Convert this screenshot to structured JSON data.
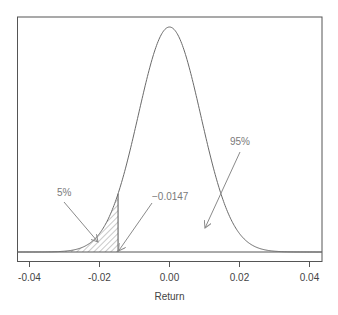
{
  "chart_data": {
    "type": "area",
    "title": "",
    "xlabel": "Return",
    "ylabel": "",
    "xlim": [
      -0.0435,
      0.0435
    ],
    "ylim": [
      0,
      1.0
    ],
    "grid": false,
    "legend": null,
    "distribution": {
      "name": "normal",
      "mean": 0.0,
      "sd": 0.00894
    },
    "x_ticks": [
      -0.04,
      -0.02,
      0.0,
      0.02,
      0.04
    ],
    "x_tick_labels": [
      "-0.04",
      "-0.02",
      "0.00",
      "0.02",
      "0.04"
    ],
    "shaded_region": {
      "from": -0.0435,
      "to": -0.0147,
      "pattern": "diagonal-hatch",
      "probability": 0.05
    },
    "var_cutoff": -0.0147,
    "annotations": [
      {
        "text": "5%",
        "text_x": -0.0295,
        "text_y_px": 196,
        "arrow_from_px": [
          64,
          202
        ],
        "arrow_to_px": [
          98,
          242
        ]
      },
      {
        "text": "−0.0147",
        "text_x": -0.0047,
        "text_y_px": 200,
        "arrow_from_px": [
          152,
          203
        ],
        "arrow_to_px": [
          118,
          251
        ]
      },
      {
        "text": "95%",
        "text_x": 0.0115,
        "text_y_px": 145,
        "arrow_from_px": [
          240,
          152
        ],
        "arrow_to_px": [
          205,
          228
        ]
      }
    ]
  },
  "axis": {
    "xlabel": "Return",
    "tick_labels": [
      "-0.04",
      "-0.02",
      "0.00",
      "0.02",
      "0.04"
    ]
  },
  "annotations": {
    "five_pct": "5%",
    "cutoff": "−0.0147",
    "ninety_five_pct": "95%"
  },
  "colors": {
    "axis": "#555555",
    "curve": "#6a6a6a",
    "hatch": "#777777",
    "arrow": "#8a8a8a",
    "annotation_text": "#7a7a7a"
  }
}
